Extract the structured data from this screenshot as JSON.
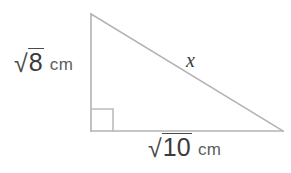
{
  "figure": {
    "type": "right-triangle-diagram",
    "background_color": "#ffffff",
    "stroke_color": "#b3b3b3",
    "text_color": "#3b3b3b"
  },
  "labels": {
    "vertical_leg": {
      "radical_sign": "√",
      "radicand": "8",
      "unit": "cm",
      "full_text": "√8 cm"
    },
    "horizontal_leg": {
      "radical_sign": "√",
      "radicand": "10",
      "unit": "cm",
      "full_text": "√10 cm"
    },
    "hypotenuse": {
      "text": "x"
    }
  },
  "geometry": {
    "vertices": {
      "top": [
        91,
        14
      ],
      "bottom_left": [
        91,
        131
      ],
      "bottom_right": [
        283,
        131
      ]
    },
    "right_angle_marker": {
      "at": "bottom_left",
      "size": 22
    }
  }
}
